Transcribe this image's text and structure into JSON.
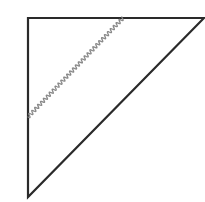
{
  "diagram": {
    "type": "triangle-spacetime-diagram",
    "background": "#ffffff",
    "triangle": {
      "vertices": [
        [
          28,
          18
        ],
        [
          204,
          18
        ],
        [
          28,
          197
        ]
      ],
      "stroke": "#2a2a2a",
      "stroke_width": 2.2
    },
    "wavy_line": {
      "start": [
        28,
        117
      ],
      "end": [
        123,
        18
      ],
      "stroke": "#8a8a8a",
      "stroke_width": 1.3,
      "amplitude": 1.8,
      "wavelength": 4.2
    }
  }
}
